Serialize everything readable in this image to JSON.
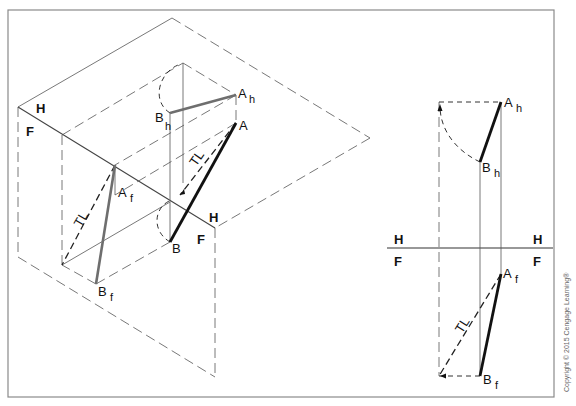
{
  "diagram": {
    "left_view": {
      "plane_labels": [
        {
          "id": "H-left",
          "text": "H"
        },
        {
          "id": "F-left",
          "text": "F"
        },
        {
          "id": "H-fold",
          "text": "H"
        },
        {
          "id": "F-fold",
          "text": "F"
        }
      ],
      "points": {
        "Ah": {
          "main": "A",
          "sub": "h"
        },
        "Bh": {
          "main": "B",
          "sub": "h"
        },
        "A": {
          "main": "A"
        },
        "B": {
          "main": "B"
        },
        "Af": {
          "main": "A",
          "sub": "f"
        },
        "Bf": {
          "main": "B",
          "sub": "f"
        }
      },
      "tl_labels": [
        "TL",
        "TL"
      ]
    },
    "right_view": {
      "fold_labels": {
        "H_left": "H",
        "F_left": "F",
        "H_right": "H",
        "F_right": "F"
      },
      "points": {
        "Ah": {
          "main": "A",
          "sub": "h"
        },
        "Bh": {
          "main": "B",
          "sub": "h"
        },
        "Af": {
          "main": "A",
          "sub": "f"
        },
        "Bf": {
          "main": "B",
          "sub": "f"
        }
      },
      "tl_label": "TL"
    },
    "copyright": "Copyright © 2015 Cengage Learning®",
    "colors": {
      "frame": "#8a8a8a",
      "line_black": "#111111",
      "line_gray": "#6e6e6e"
    }
  }
}
